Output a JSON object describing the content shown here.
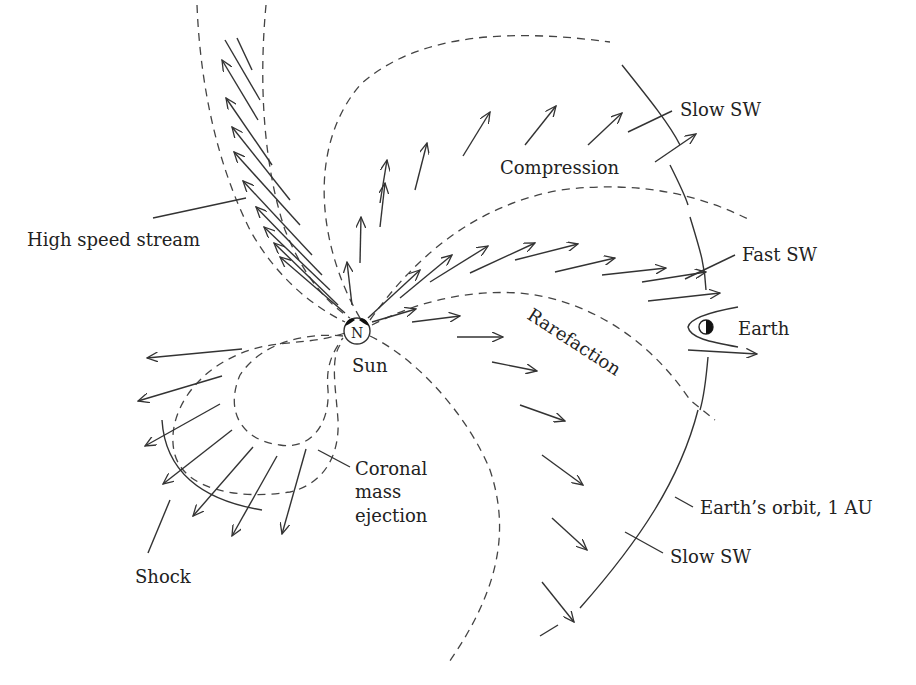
{
  "diagram": {
    "background": "#ffffff",
    "ink_color": "#222222",
    "sun": {
      "symbol": "N",
      "label": "Sun"
    },
    "earth": {
      "symbol": "half-filled-circle",
      "label": "Earth"
    },
    "labels": {
      "slow_sw_top": "Slow SW",
      "compression": "Compression",
      "fast_sw": "Fast SW",
      "high_speed_stream": "High speed stream",
      "rarefaction": "Rarefaction",
      "cme_line1": "Coronal",
      "cme_line2": "mass",
      "cme_line3": "ejection",
      "shock": "Shock",
      "earth_orbit": "Earth’s orbit, 1 AU",
      "slow_sw_bottom": "Slow SW"
    },
    "regions": [
      "High speed stream",
      "Compression",
      "Rarefaction",
      "Coronal mass ejection",
      "Shock",
      "Slow SW",
      "Fast SW"
    ]
  }
}
